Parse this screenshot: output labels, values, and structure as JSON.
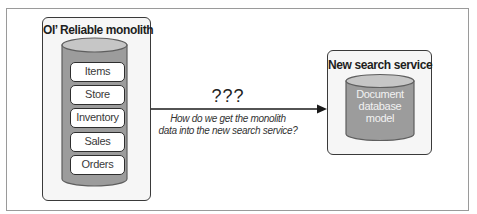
{
  "diagram": {
    "source": {
      "title": "Ol’ Reliable monolith",
      "database": {
        "tables": [
          {
            "label": "Items"
          },
          {
            "label": "Store"
          },
          {
            "label": "Inventory"
          },
          {
            "label": "Sales"
          },
          {
            "label": "Orders"
          }
        ]
      }
    },
    "connector": {
      "heading": "???",
      "caption_line1": "How do we get the monolith",
      "caption_line2": "data into the new search service?",
      "direction": "source-to-target"
    },
    "target": {
      "title": "New search service",
      "database": {
        "label_line1": "Document",
        "label_line2": "database",
        "label_line3": "model"
      }
    }
  },
  "colors": {
    "box_fill": "#f6f6f6",
    "box_border": "#3a3a3a",
    "cylinder_body": "#9c9c9c",
    "cylinder_top": "#c6c6c6",
    "cylinder_border": "#5e5e5e",
    "arrow": "#1a1a1a"
  }
}
